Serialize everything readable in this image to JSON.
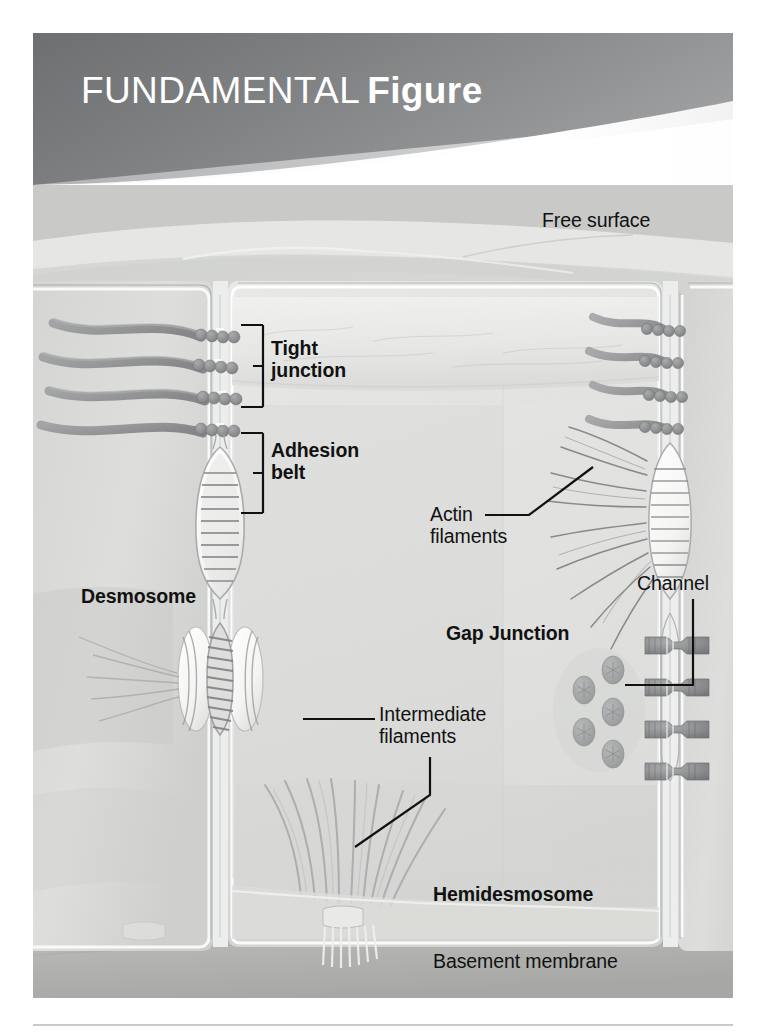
{
  "header": {
    "title_light": "FUNDAMENTAL",
    "title_bold": "Figure",
    "background_color": "#808285",
    "text_color": "#ffffff",
    "swoosh_color": "#ffffff"
  },
  "figure": {
    "background_color": "#d8d8d6",
    "basement_membrane_color": "#b6b7b5",
    "cell_fill_color": "#e2e3e1",
    "outline_color": "#8e9091",
    "structure_color": "#8a8c8e",
    "label_color": "#111111"
  },
  "labels": {
    "free_surface": "Free surface",
    "tight_junction": "Tight\njunction",
    "adhesion_belt": "Adhesion\nbelt",
    "desmosome": "Desmosome",
    "actin_filaments": "Actin\nfilaments",
    "gap_junction": "Gap Junction",
    "channel": "Channel",
    "intermediate_filaments": "Intermediate\nfilaments",
    "hemidesmosome": "Hemidesmosome",
    "basement_membrane": "Basement membrane"
  },
  "label_styles": {
    "free_surface": "regular",
    "tight_junction": "bold",
    "adhesion_belt": "bold",
    "desmosome": "bold",
    "actin_filaments": "regular",
    "gap_junction": "bold",
    "channel": "regular",
    "intermediate_filaments": "regular",
    "hemidesmosome": "bold",
    "basement_membrane": "regular"
  }
}
